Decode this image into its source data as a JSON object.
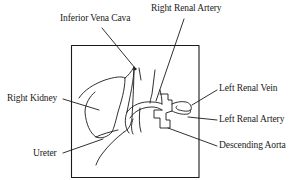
{
  "diagram": {
    "type": "anatomical-diagram",
    "labels": [
      {
        "id": "inferior-vena-cava",
        "text": "Inferior Vena Cava",
        "x": 60,
        "y": 13
      },
      {
        "id": "right-renal-artery",
        "text": "Right Renal Artery",
        "x": 151,
        "y": 3
      },
      {
        "id": "right-kidney",
        "text": "Right Kidney",
        "x": 7,
        "y": 93
      },
      {
        "id": "ureter",
        "text": "Ureter",
        "x": 33,
        "y": 148
      },
      {
        "id": "left-renal-vein",
        "text": "Left Renal Vein",
        "x": 219,
        "y": 83
      },
      {
        "id": "left-renal-artery",
        "text": "Left Renal Artery",
        "x": 219,
        "y": 114
      },
      {
        "id": "descending-aorta",
        "text": "Descending Aorta",
        "x": 219,
        "y": 140
      }
    ],
    "colors": {
      "line": "#1a1a1a",
      "background": "#ffffff"
    }
  }
}
